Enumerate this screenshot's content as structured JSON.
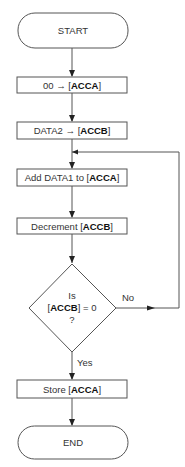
{
  "flowchart": {
    "start": "START",
    "end": "END",
    "steps": [
      {
        "pre": "00 ",
        "arrow": "→ ",
        "open": "[",
        "reg": "ACCA",
        "close": "]"
      },
      {
        "pre": "DATA2 ",
        "arrow": "→ ",
        "open": "[",
        "reg": "ACCB",
        "close": "]"
      },
      {
        "pre": "Add DATA1 to ",
        "arrow": "",
        "open": "[",
        "reg": "ACCA",
        "close": "]"
      },
      {
        "pre": "Decrement ",
        "arrow": "",
        "open": "[",
        "reg": "ACCB",
        "close": "]"
      }
    ],
    "decision": {
      "line1": "Is",
      "open": "[",
      "reg": "ACCB",
      "rest": "] = 0",
      "line3": "?",
      "yes_label": "Yes",
      "no_label": "No"
    },
    "final_step": {
      "pre": "Store ",
      "open": "[",
      "reg": "ACCA",
      "close": "]"
    }
  }
}
